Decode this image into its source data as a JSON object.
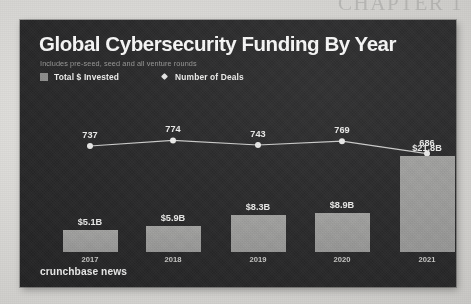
{
  "page": {
    "ghost_heading": "CHAPTER 1"
  },
  "chart": {
    "title": "Global Cybersecurity Funding By Year",
    "subtitle": "Includes pre-seed, seed and all venture rounds",
    "footer": "crunchbase news",
    "legend": [
      {
        "label": "Total $ Invested",
        "marker": "square-swatch-icon",
        "color": "#9c9c9b"
      },
      {
        "label": "Number of Deals",
        "marker": "diamond-marker-icon",
        "color": "#e9e9e8"
      }
    ],
    "colors": {
      "card_background": "#2b2b2c",
      "bar": "#9c9c9b",
      "line": "#cfcfce",
      "text": "#f0f0ef",
      "muted_text": "#9a9a99"
    }
  },
  "chart_data": {
    "type": "bar",
    "title": "Global Cybersecurity Funding By Year",
    "subtitle": "Includes pre-seed, seed and all venture rounds",
    "xlabel": "",
    "ylabel": "",
    "grid": false,
    "legend_position": "top-left",
    "categories": [
      "2017",
      "2018",
      "2019",
      "2020",
      "2021"
    ],
    "series": [
      {
        "name": "Total $ Invested",
        "type": "bar",
        "values": [
          5.1,
          5.9,
          8.3,
          8.9,
          21.8
        ],
        "unit": "$B",
        "labels": [
          "$5.1B",
          "$5.9B",
          "$8.3B",
          "$8.9B",
          "$21.8B"
        ],
        "ylim": [
          0,
          24
        ]
      },
      {
        "name": "Number of Deals",
        "type": "line",
        "values": [
          737,
          774,
          743,
          769,
          686
        ],
        "labels": [
          "737",
          "774",
          "743",
          "769",
          "686"
        ],
        "ylim": [
          600,
          820
        ]
      }
    ],
    "source": "crunchbase news"
  }
}
